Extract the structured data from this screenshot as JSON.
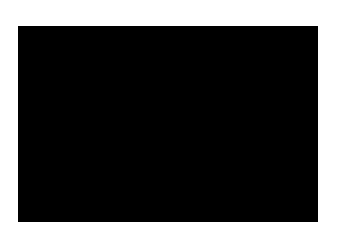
{
  "figure": {
    "background_color": "#ffffff",
    "plot": {
      "left": 18,
      "top": 26,
      "width": 300,
      "height": 196,
      "background_color": "#000000",
      "foreground_color": "#ffffff"
    }
  },
  "labels": {
    "y_top": ".5",
    "y_axis_name": "x1",
    "x_axis_name": "x2",
    "x_left": "-.5",
    "x_center": "0",
    "x_right": ".5"
  },
  "chart_data": {
    "type": "heatmap",
    "title": "",
    "subtitle": "",
    "xlabel": "x2",
    "ylabel": "x1",
    "xlim": [
      -0.5,
      0.5
    ],
    "ylim": [
      -0.5,
      0.5
    ],
    "xticks": [
      -0.5,
      0,
      0.5
    ],
    "xticklabels": [
      "-.5",
      "0",
      ".5"
    ],
    "yticks": [
      0.5
    ],
    "yticklabels": [
      ".5"
    ],
    "grid": false,
    "legend": null,
    "colormap": "gray",
    "colormap_range": [
      0,
      1
    ],
    "symmetry": [
      "mirror-x",
      "mirror-y"
    ],
    "grid_size": [
      150,
      98
    ],
    "annotations": [
      {
        "text": ".5",
        "x": -0.5,
        "y": 0.5,
        "position": "top-left-outside"
      },
      {
        "text": "x2",
        "x": 0.0,
        "y": 0.5,
        "position": "top-center-outside"
      },
      {
        "text": "x1",
        "x": 0.5,
        "y": 0.0,
        "position": "right-middle-outside"
      },
      {
        "text": "-.5",
        "x": -0.5,
        "y": -0.5,
        "position": "bottom-left-outside"
      },
      {
        "text": "0",
        "x": 0.0,
        "y": -0.5,
        "position": "bottom-center-outside"
      },
      {
        "text": ".5",
        "x": 0.5,
        "y": -0.5,
        "position": "bottom-right-outside"
      }
    ]
  }
}
